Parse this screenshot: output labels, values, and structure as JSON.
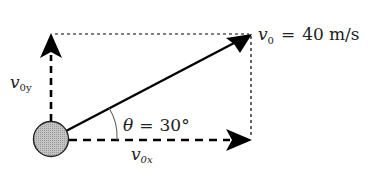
{
  "diagram": {
    "vectors": {
      "v0": {
        "symbol": "v",
        "subscript": "0",
        "equals": "=",
        "value": "40",
        "unit": "m/s"
      },
      "v0x": {
        "symbol": "v",
        "subscript": "0x"
      },
      "v0y": {
        "symbol": "v",
        "subscript": "0y"
      }
    },
    "angle": {
      "symbol": "θ",
      "equals": "=",
      "value": "30°"
    },
    "colors": {
      "stroke": "#000000",
      "ball_fill": "#b8b8b8",
      "ball_stroke": "#222222",
      "text": "#222222",
      "background": "#ffffff"
    }
  }
}
